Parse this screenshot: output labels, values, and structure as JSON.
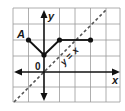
{
  "figure": {
    "type": "coordinate-plane-graph",
    "grid": {
      "x_min": -2,
      "x_max": 5,
      "y_min": -2,
      "y_max": 4,
      "cell_px": 15.5
    },
    "axes": {
      "x_label": "x",
      "y_label": "y",
      "origin_label": "0"
    },
    "point_label": "A",
    "line_label": "y = x",
    "points": [
      {
        "name": "A",
        "x": -1,
        "y": 2
      },
      {
        "name": "vertex",
        "x": 0,
        "y": 1
      },
      {
        "name": "",
        "x": 1,
        "y": 2
      },
      {
        "name": "",
        "x": 3,
        "y": 2
      }
    ],
    "segments": [
      {
        "from": [
          -1,
          2
        ],
        "to": [
          0,
          1
        ]
      },
      {
        "from": [
          0,
          1
        ],
        "to": [
          1,
          2
        ]
      },
      {
        "from": [
          1,
          2
        ],
        "to": [
          3,
          2
        ]
      }
    ],
    "dashed_line": {
      "equation": "y = x",
      "from": [
        -2,
        -2
      ],
      "to": [
        4,
        4
      ]
    },
    "colors": {
      "grid": "#9a9a9a",
      "axis": "#111111",
      "graph": "#111111",
      "dashed": "#555555"
    }
  }
}
